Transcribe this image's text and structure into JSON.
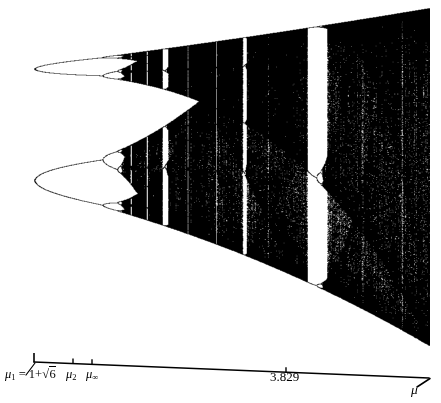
{
  "figure": {
    "title": "",
    "type": "bifurcation-diagram",
    "background_color": "#ffffff",
    "ink_color": "#000000"
  },
  "axis": {
    "name": "mu-axis",
    "label": "μ",
    "label_is_italic": true,
    "start_x": 34,
    "end_x": 429,
    "baseline_y_left": 362,
    "baseline_y_right": 378,
    "ticks": [
      {
        "id": "mu1",
        "x": 34,
        "label_html": "μ<sub>1</sub> = 1+√6",
        "label_text": "μ1 = 1+√6",
        "value": 3.449
      },
      {
        "id": "mu2",
        "x": 73,
        "label_html": "μ<sub>2</sub>",
        "label_text": "μ2",
        "value": 3.544
      },
      {
        "id": "muinf",
        "x": 92,
        "label_html": "μ<sub>∞</sub>",
        "label_text": "μ∞",
        "value": 3.5699
      },
      {
        "id": "m3829",
        "x": 286,
        "label_html": "3.829",
        "label_text": "3.829",
        "value": 3.829
      }
    ]
  },
  "chart_data": {
    "type": "scatter",
    "title": "",
    "xlabel": "μ",
    "ylabel": "",
    "xlim": [
      3.4485,
      4.0
    ],
    "ylim": [
      0.0,
      1.0
    ],
    "grid": false,
    "legend": null,
    "map_equation": "x_{n+1} = μ x_n (1 - x_n)",
    "annotations": [
      {
        "text": "μ1 = 1+√6",
        "x": 3.449,
        "note": "onset of period-4"
      },
      {
        "text": "μ2",
        "x": 3.544,
        "note": "onset of period-8"
      },
      {
        "text": "μ∞",
        "x": 3.5699,
        "note": "accumulation point / onset of chaos"
      },
      {
        "text": "3.829",
        "x": 3.829,
        "note": "period-3 window"
      }
    ],
    "x": [
      3.449,
      3.544,
      3.5699,
      3.829,
      4.0
    ],
    "tick_labels": [
      "μ1 = 1+√6",
      "μ2",
      "μ∞",
      "3.829"
    ],
    "periodic_windows": [
      {
        "period": 3,
        "x_start": 3.8284,
        "x_end": 3.8415
      },
      {
        "period": 5,
        "x_start": 3.7382,
        "x_end": 3.7442
      },
      {
        "period": 6,
        "x_start": 3.6265,
        "x_end": 3.6304
      }
    ]
  }
}
